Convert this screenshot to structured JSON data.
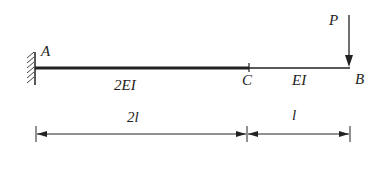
{
  "diagram": {
    "type": "cantilever-beam",
    "points": {
      "A": "A",
      "B": "B",
      "C": "C"
    },
    "load_label": "P",
    "segments": [
      {
        "name": "AC",
        "stiffness": "2EI",
        "length": "2l"
      },
      {
        "name": "CB",
        "stiffness": "EI",
        "length": "l"
      }
    ],
    "colors": {
      "line": "#222222",
      "background": "#ffffff"
    }
  }
}
